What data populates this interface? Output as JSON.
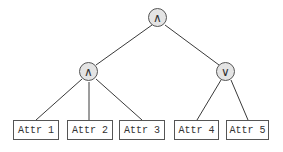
{
  "diagram": {
    "type": "logic-tree",
    "root": {
      "id": "root",
      "operator": "∧",
      "operator_name": "AND",
      "children": [
        "and_node",
        "or_node"
      ]
    },
    "nodes": [
      {
        "id": "root",
        "symbol": "∧",
        "name": "AND",
        "cx": 158,
        "cy": 18
      },
      {
        "id": "and_node",
        "symbol": "∧",
        "name": "AND",
        "cx": 89,
        "cy": 72
      },
      {
        "id": "or_node",
        "symbol": "∨",
        "name": "OR",
        "cx": 226,
        "cy": 72
      }
    ],
    "leaves": [
      {
        "id": "attr1",
        "label": "Attr 1",
        "parent": "and_node"
      },
      {
        "id": "attr2",
        "label": "Attr 2",
        "parent": "and_node"
      },
      {
        "id": "attr3",
        "label": "Attr 3",
        "parent": "and_node"
      },
      {
        "id": "attr4",
        "label": "Attr 4",
        "parent": "or_node"
      },
      {
        "id": "attr5",
        "label": "Attr 5",
        "parent": "or_node"
      }
    ],
    "edges": [
      {
        "from": "root",
        "to": "and_node"
      },
      {
        "from": "root",
        "to": "or_node"
      },
      {
        "from": "and_node",
        "to": "attr1"
      },
      {
        "from": "and_node",
        "to": "attr2"
      },
      {
        "from": "and_node",
        "to": "attr3"
      },
      {
        "from": "or_node",
        "to": "attr4"
      },
      {
        "from": "or_node",
        "to": "attr5"
      }
    ]
  },
  "colors": {
    "node_fill": "#e4e4e4",
    "stroke": "#555555",
    "edge": "#3a3a3a",
    "background": "#ffffff"
  }
}
